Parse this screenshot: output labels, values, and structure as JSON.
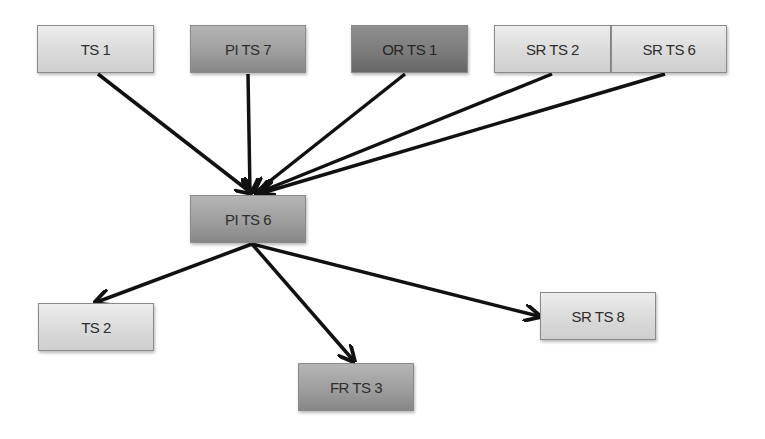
{
  "diagram": {
    "type": "directed-graph",
    "nodes": [
      {
        "id": "ts1",
        "label": "TS 1",
        "shade": "light",
        "x": 37,
        "y": 25,
        "w": 117,
        "h": 48
      },
      {
        "id": "pits7",
        "label": "PI TS 7",
        "shade": "mid",
        "x": 190,
        "y": 25,
        "w": 116,
        "h": 48
      },
      {
        "id": "orts1",
        "label": "OR TS 1",
        "shade": "dark",
        "x": 351,
        "y": 25,
        "w": 117,
        "h": 48
      },
      {
        "id": "srts2",
        "label": "SR TS 2",
        "shade": "light",
        "x": 494,
        "y": 25,
        "w": 117,
        "h": 48
      },
      {
        "id": "srts6",
        "label": "SR TS 6",
        "shade": "light",
        "x": 611,
        "y": 25,
        "w": 116,
        "h": 48
      },
      {
        "id": "pits6",
        "label": "PI TS 6",
        "shade": "mid",
        "x": 190,
        "y": 195,
        "w": 116,
        "h": 48
      },
      {
        "id": "ts2",
        "label": "TS 2",
        "shade": "light",
        "x": 38,
        "y": 303,
        "w": 116,
        "h": 48
      },
      {
        "id": "frts3",
        "label": "FR TS 3",
        "shade": "mid",
        "x": 298,
        "y": 363,
        "w": 116,
        "h": 48
      },
      {
        "id": "srts8",
        "label": "SR TS 8",
        "shade": "light",
        "x": 540,
        "y": 292,
        "w": 116,
        "h": 48
      }
    ],
    "edges": [
      {
        "from": "ts1",
        "to": "pits6",
        "x1": 98,
        "y1": 74,
        "x2": 250,
        "y2": 192
      },
      {
        "from": "pits7",
        "to": "pits6",
        "x1": 248,
        "y1": 74,
        "x2": 250,
        "y2": 192
      },
      {
        "from": "orts1",
        "to": "pits6",
        "x1": 405,
        "y1": 74,
        "x2": 256,
        "y2": 192
      },
      {
        "from": "srts2",
        "to": "pits6",
        "x1": 552,
        "y1": 74,
        "x2": 260,
        "y2": 192
      },
      {
        "from": "srts6",
        "to": "pits6",
        "x1": 665,
        "y1": 74,
        "x2": 262,
        "y2": 193
      },
      {
        "from": "pits6",
        "to": "ts2",
        "x1": 252,
        "y1": 244,
        "x2": 97,
        "y2": 302
      },
      {
        "from": "pits6",
        "to": "frts3",
        "x1": 252,
        "y1": 244,
        "x2": 353,
        "y2": 360
      },
      {
        "from": "pits6",
        "to": "srts8",
        "x1": 252,
        "y1": 244,
        "x2": 538,
        "y2": 316
      }
    ],
    "colors": {
      "light": "#dcdcdc",
      "mid": "#9e9e9e",
      "dark": "#7a7a7a",
      "edge": "#111111"
    }
  }
}
